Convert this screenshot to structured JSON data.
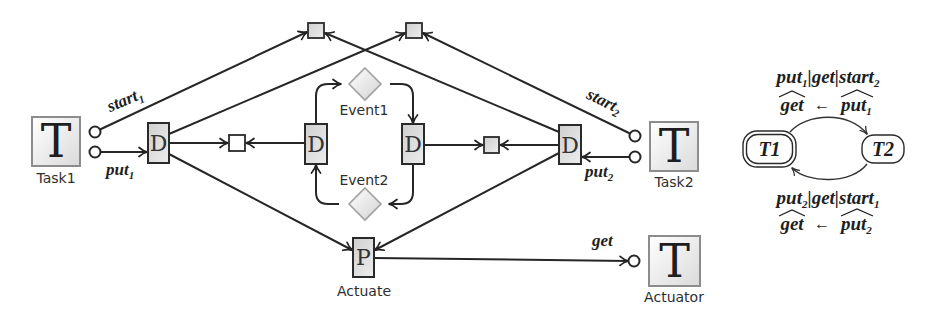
{
  "colors": {
    "stroke": "#262626",
    "node_fill": "#d8d8d8",
    "task_border": "#8c8c8c",
    "event_border": "#a0a0a0",
    "background": "#ffffff"
  },
  "figure": {
    "tasks": {
      "task1": {
        "glyph": "T",
        "label": "Task1"
      },
      "task2": {
        "glyph": "T",
        "label": "Task2"
      },
      "actuator": {
        "glyph": "T",
        "label": "Actuator"
      }
    },
    "nodes": {
      "d_glyph": "D",
      "p_glyph": "P",
      "actuate_label": "Actuate"
    },
    "events": {
      "event1": "Event1",
      "event2": "Event2"
    },
    "port_labels": {
      "start1": {
        "name": "start",
        "sub": "1"
      },
      "put1": {
        "name": "put",
        "sub": "1"
      },
      "start2": {
        "name": "start",
        "sub": "2"
      },
      "put2": {
        "name": "put",
        "sub": "2"
      },
      "get": {
        "name": "get"
      }
    }
  },
  "automaton": {
    "states": {
      "t1": {
        "label": "T1",
        "initial": true
      },
      "t2": {
        "label": "T2",
        "initial": false
      }
    },
    "transitions": [
      {
        "from": "T1",
        "to": "T2",
        "trigger": {
          "a": "put",
          "a_sub": "1",
          "mid": "|get|",
          "c": "start",
          "c_sub": "2"
        },
        "update": {
          "lhs": "get",
          "arrow": "←",
          "rhs": "put",
          "rhs_sub": "1"
        }
      },
      {
        "from": "T2",
        "to": "T1",
        "trigger": {
          "a": "put",
          "a_sub": "2",
          "mid": "|get|",
          "c": "start",
          "c_sub": "1"
        },
        "update": {
          "lhs": "get",
          "arrow": "←",
          "rhs": "put",
          "rhs_sub": "2"
        }
      }
    ]
  }
}
